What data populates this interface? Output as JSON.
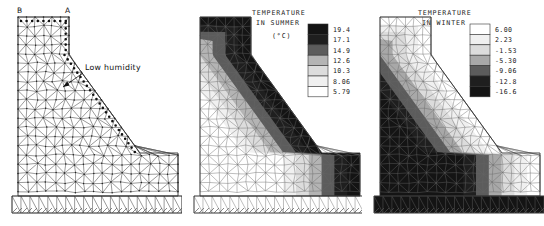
{
  "figure": {
    "panels": [
      {
        "id": "mesh",
        "name": "finite-element-mesh",
        "labels": {
          "crest_left": "B",
          "crest_right": "A",
          "annotation": "Low humidity"
        }
      },
      {
        "id": "summer",
        "name": "temperature-in-summer",
        "title_line1": "TEMPERATURE",
        "title_line2": "IN SUMMER",
        "units": "(°C)"
      },
      {
        "id": "winter",
        "name": "temperature-in-winter",
        "title_line1": "TEMPERATURE",
        "title_line2": "IN WINTER",
        "units": ""
      }
    ]
  },
  "chart_data": [
    {
      "type": "heatmap",
      "id": "mesh",
      "title": "",
      "xlabel": "",
      "ylabel": "",
      "description": "Finite element triangular mesh of a gravity dam cross-section with foundation strip",
      "annotations": [
        "B",
        "A",
        "Low humidity"
      ],
      "legend": null
    },
    {
      "type": "heatmap",
      "id": "summer",
      "title": "TEMPERATURE IN SUMMER",
      "units": "(°C)",
      "xlabel": "",
      "ylabel": "",
      "legend_position": "top-right",
      "legend": {
        "labels": [
          "19.4",
          "17.1",
          "14.9",
          "12.6",
          "10.3",
          "8.06",
          "5.79"
        ],
        "values": [
          19.4,
          17.1,
          14.9,
          12.6,
          10.3,
          8.06,
          5.79
        ],
        "swatch_colors": [
          "#141414",
          "#1f1f1f",
          "#5c5c5c",
          "#b4b4b4",
          "#dcdcdc",
          "#f0f0f0",
          "#ffffff"
        ],
        "order": "dark-to-light"
      },
      "band_colors": [
        "#141414",
        "#1f1f1f",
        "#5c5c5c",
        "#b4b4b4",
        "#dcdcdc",
        "#f0f0f0",
        "#ffffff"
      ]
    },
    {
      "type": "heatmap",
      "id": "winter",
      "title": "TEMPERATURE IN WINTER",
      "units": "",
      "xlabel": "",
      "ylabel": "",
      "legend_position": "top-right",
      "legend": {
        "labels": [
          "6.00",
          "2.23",
          "-1.53",
          "-5.30",
          "-9.06",
          "-12.8",
          "-16.6"
        ],
        "values": [
          6.0,
          2.23,
          -1.53,
          -5.3,
          -9.06,
          -12.8,
          -16.6
        ],
        "swatch_colors": [
          "#ffffff",
          "#f0f0f0",
          "#dcdcdc",
          "#a8a8a8",
          "#5c5c5c",
          "#1f1f1f",
          "#141414"
        ],
        "order": "light-to-dark"
      },
      "band_colors": [
        "#ffffff",
        "#f0f0f0",
        "#dcdcdc",
        "#a8a8a8",
        "#5c5c5c",
        "#1f1f1f",
        "#141414"
      ]
    }
  ],
  "colors": {
    "line": "#444444",
    "text": "#111111",
    "background": "#ffffff"
  }
}
